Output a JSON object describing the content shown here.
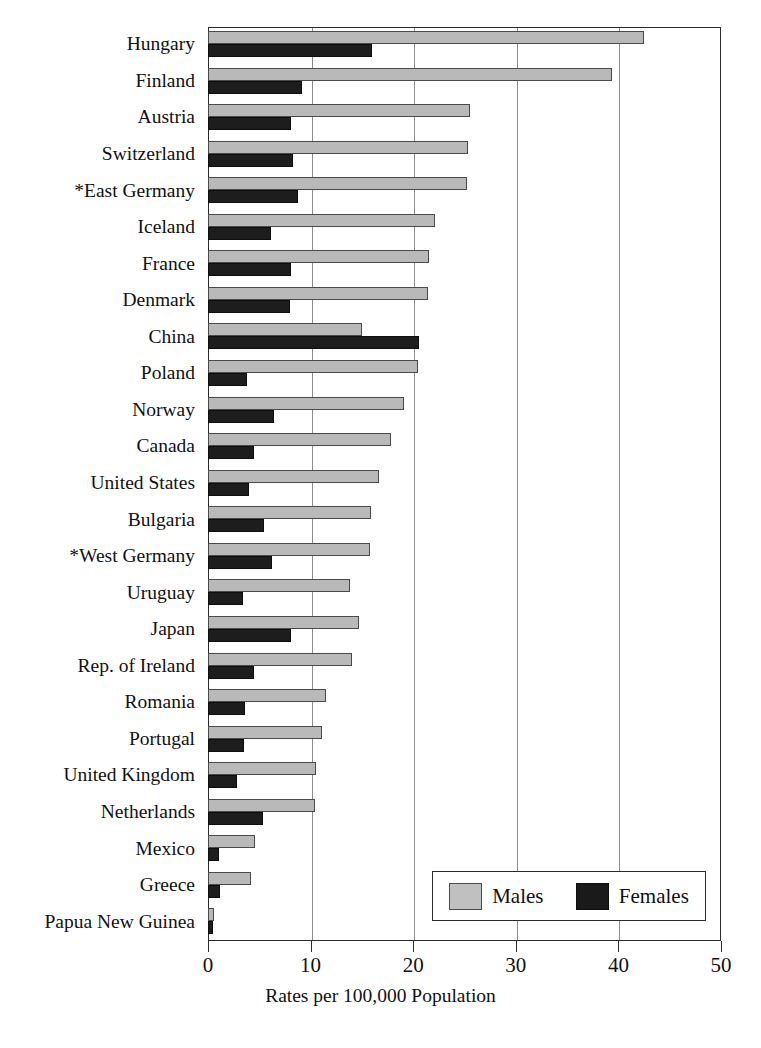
{
  "chart_data": {
    "type": "bar",
    "orientation": "horizontal",
    "title": "",
    "xlabel": "Rates per 100,000 Population",
    "ylabel": "",
    "xlim": [
      0,
      50
    ],
    "xticks": [
      0,
      10,
      20,
      30,
      40,
      50
    ],
    "xtick_labels": [
      "0",
      "10",
      "20",
      "30",
      "40",
      "50"
    ],
    "grid": true,
    "grid_axis": "x",
    "legend_position": "bottom-right",
    "categories": [
      "Hungary",
      "Finland",
      "Austria",
      "Switzerland",
      "*East Germany",
      "Iceland",
      "France",
      "Denmark",
      "China",
      "Poland",
      "Norway",
      "Canada",
      "United States",
      "Bulgaria",
      "*West Germany",
      "Uruguay",
      "Japan",
      "Rep. of Ireland",
      "Romania",
      "Portugal",
      "United Kingdom",
      "Netherlands",
      "Mexico",
      "Greece",
      "Papua New Guinea"
    ],
    "series": [
      {
        "name": "Males",
        "color": "#b9b9b9",
        "values": [
          42.5,
          39.4,
          25.5,
          25.3,
          25.2,
          22.1,
          21.5,
          21.4,
          15.0,
          20.5,
          19.1,
          17.8,
          16.7,
          15.9,
          15.8,
          13.8,
          14.7,
          14.0,
          11.5,
          11.1,
          10.5,
          10.4,
          4.6,
          4.2,
          0.6
        ]
      },
      {
        "name": "Females",
        "color": "#1d1d1d",
        "values": [
          16.0,
          9.2,
          8.1,
          8.3,
          8.8,
          6.1,
          8.1,
          8.0,
          20.6,
          3.8,
          6.4,
          4.5,
          4.0,
          5.5,
          6.2,
          3.4,
          8.1,
          4.5,
          3.6,
          3.5,
          2.8,
          5.4,
          1.1,
          1.2,
          0.5
        ]
      }
    ]
  },
  "legend": {
    "items": [
      {
        "label": "Males",
        "swatch": "males-swatch"
      },
      {
        "label": "Females",
        "swatch": "females-swatch"
      }
    ]
  },
  "axis": {
    "x_title": "Rates per 100,000 Population"
  }
}
